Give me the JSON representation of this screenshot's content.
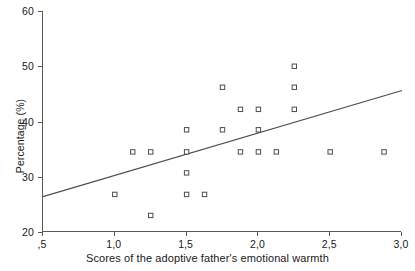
{
  "chart_data": {
    "type": "scatter",
    "title": "",
    "xlabel": "Scores of the adoptive father's emotional warmth",
    "ylabel": "Percentage (%)",
    "xlim": [
      0.5,
      3.0
    ],
    "ylim": [
      20,
      60
    ],
    "grid": false,
    "legend": null,
    "x_tick_labels": [
      ",5",
      "1,0",
      "1,5",
      "2,0",
      "2,5",
      "3,0"
    ],
    "x_tick_values": [
      0.5,
      1.0,
      1.5,
      2.0,
      2.5,
      3.0
    ],
    "y_tick_labels": [
      "20",
      "30",
      "40",
      "50",
      "60"
    ],
    "y_tick_values": [
      20,
      30,
      40,
      50,
      60
    ],
    "marker_style": "open-square",
    "marker_color": "#4d4d4d",
    "points": [
      {
        "x": 1.0,
        "y": 26.8
      },
      {
        "x": 1.125,
        "y": 34.5
      },
      {
        "x": 1.25,
        "y": 34.5
      },
      {
        "x": 1.25,
        "y": 23.0
      },
      {
        "x": 1.5,
        "y": 38.5
      },
      {
        "x": 1.5,
        "y": 34.5
      },
      {
        "x": 1.5,
        "y": 30.7
      },
      {
        "x": 1.5,
        "y": 26.8
      },
      {
        "x": 1.625,
        "y": 26.8
      },
      {
        "x": 1.75,
        "y": 46.2
      },
      {
        "x": 1.75,
        "y": 38.5
      },
      {
        "x": 1.875,
        "y": 42.2
      },
      {
        "x": 1.875,
        "y": 34.5
      },
      {
        "x": 2.0,
        "y": 42.2
      },
      {
        "x": 2.0,
        "y": 38.5
      },
      {
        "x": 2.0,
        "y": 34.5
      },
      {
        "x": 2.125,
        "y": 34.5
      },
      {
        "x": 2.25,
        "y": 50.0
      },
      {
        "x": 2.25,
        "y": 46.2
      },
      {
        "x": 2.25,
        "y": 42.2
      },
      {
        "x": 2.5,
        "y": 34.5
      },
      {
        "x": 2.875,
        "y": 34.5
      }
    ],
    "trendline": {
      "type": "linear-fit",
      "x_start": 0.5,
      "y_start": 26.4,
      "x_end": 3.0,
      "y_end": 45.6,
      "color": "#4d4d4d"
    }
  }
}
